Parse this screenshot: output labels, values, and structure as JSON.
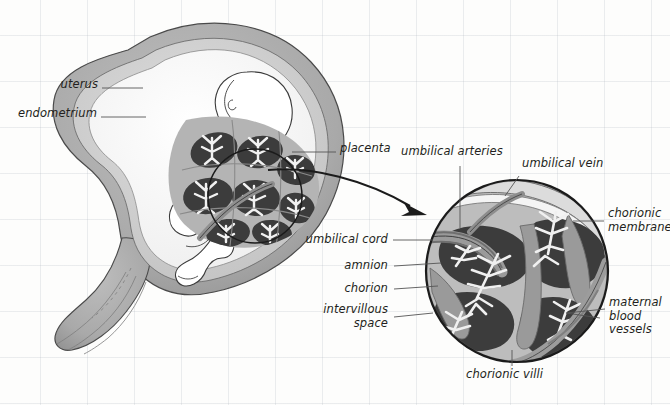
{
  "figure": {
    "background_color": "#fdfdfc",
    "grid_color": "#aab2ba"
  },
  "palette": {
    "outline": "#231f20",
    "uterus_wall": "#a9a9a9",
    "uterus_wall_dark": "#8f8f8f",
    "endometrium": "#c6c6c6",
    "amniotic_cavity": "#ffffff",
    "fetus": "#ffffff",
    "placenta_tissue": "#b4b4b4",
    "intervillous_space": "#3c3c3c",
    "villi": "#ededed",
    "vessel_gray": "#9a9a9a",
    "leader_line": "#555555"
  },
  "main_view": {
    "name": "uterus-fetus-cross-section",
    "labels": [
      {
        "id": "uterus",
        "text": "uterus",
        "x": 52,
        "y": 83,
        "align": "right",
        "leader": {
          "x1": 102,
          "y1": 88,
          "x2": 143,
          "y2": 88
        }
      },
      {
        "id": "endometrium",
        "text": "endometrium",
        "x": 14,
        "y": 112,
        "align": "right",
        "leader": {
          "x1": 101,
          "y1": 117,
          "x2": 146,
          "y2": 117
        }
      },
      {
        "id": "placenta",
        "text": "placenta",
        "x": 341,
        "y": 146,
        "align": "left",
        "leader": {
          "x1": 292,
          "y1": 152,
          "x2": 336,
          "y2": 152
        }
      }
    ]
  },
  "detail_view": {
    "name": "chorionic-villi-detail-circle",
    "circle": {
      "cx": 517,
      "cy": 271,
      "r": 92
    },
    "source_circle": {
      "cx": 255,
      "cy": 196,
      "r": 48
    },
    "arrow": {
      "from_x": 265,
      "from_y": 172,
      "to_x": 424,
      "to_y": 213
    },
    "labels": [
      {
        "id": "umbilical-arteries",
        "text": "umbilical arteries",
        "x": 401,
        "y": 150,
        "align": "left",
        "leader": {
          "x1": 460,
          "y1": 166,
          "x2": 460,
          "y2": 226
        }
      },
      {
        "id": "umbilical-vein",
        "text": "umbilical vein",
        "x": 521,
        "y": 160,
        "align": "left",
        "leader": {
          "x1": 519,
          "y1": 176,
          "x2": 506,
          "y2": 196
        }
      },
      {
        "id": "chorionic-membrane",
        "text": "chorionic\nmembrane",
        "x": 608,
        "y": 207,
        "align": "left",
        "leader": {
          "x1": 573,
          "y1": 221,
          "x2": 604,
          "y2": 221
        }
      },
      {
        "id": "umbilical-cord",
        "text": "umbilical cord",
        "x": 302,
        "y": 234,
        "align": "right",
        "leader": {
          "x1": 393,
          "y1": 240,
          "x2": 432,
          "y2": 240
        }
      },
      {
        "id": "amnion",
        "text": "amnion",
        "x": 345,
        "y": 261,
        "align": "right",
        "leader": {
          "x1": 394,
          "y1": 266,
          "x2": 440,
          "y2": 264
        }
      },
      {
        "id": "chorion",
        "text": "chorion",
        "x": 345,
        "y": 284,
        "align": "right",
        "leader": {
          "x1": 394,
          "y1": 289,
          "x2": 437,
          "y2": 287
        }
      },
      {
        "id": "intervillous-space",
        "text": "intervillous\nspace",
        "x": 337,
        "y": 300,
        "align": "right",
        "leader": {
          "x1": 394,
          "y1": 317,
          "x2": 432,
          "y2": 314
        }
      },
      {
        "id": "maternal-blood-vessels",
        "text": "maternal\nblood\nvessels",
        "x": 609,
        "y": 295,
        "align": "left",
        "leader": {
          "x1": 566,
          "y1": 313,
          "x2": 605,
          "y2": 310
        }
      },
      {
        "id": "chorionic-villi",
        "text": "chorionic villi",
        "x": 468,
        "y": 370,
        "align": "left",
        "leader": {
          "x1": 512,
          "y1": 352,
          "x2": 512,
          "y2": 366
        }
      }
    ]
  }
}
